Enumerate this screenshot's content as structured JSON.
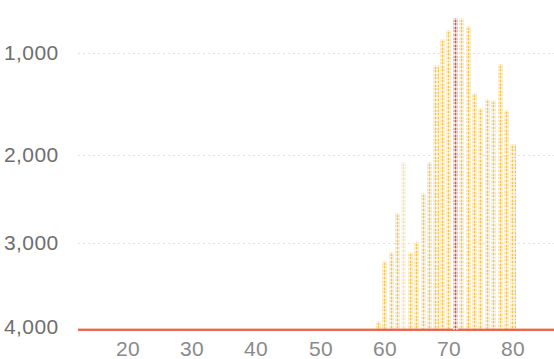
{
  "chart_data": {
    "type": "bar",
    "title": "",
    "subtitle": "",
    "xlabel": "",
    "ylabel": "",
    "orientation": "vertical",
    "y_axis_inverted": true,
    "grid": true,
    "legend": null,
    "xlim": [
      14,
      86
    ],
    "ylim": [
      4200,
      500
    ],
    "y_ticks": [
      1000,
      2000,
      3000,
      4000
    ],
    "y_tick_labels": [
      "1,000",
      "2,000",
      "3,000",
      "4,000"
    ],
    "x_ticks": [
      20,
      30,
      40,
      50,
      60,
      70,
      80
    ],
    "x_tick_labels": [
      "20",
      "30",
      "40",
      "50",
      "60",
      "70",
      "80"
    ],
    "baseline_value": 4000,
    "colors": {
      "bar": "#f2c04a",
      "bar_pale": "#f8dd9a",
      "highlight": "#d9452c",
      "baseline": "#e8553a",
      "gridline": "#d9dde3",
      "tick_label": "#7a7a7a"
    },
    "highlight_x": 71,
    "categories": [
      59,
      60,
      61,
      62,
      63,
      64,
      65,
      66,
      67,
      68,
      69,
      70,
      71,
      72,
      73,
      74,
      75,
      76,
      77,
      78,
      79,
      80
    ],
    "values": [
      3900,
      3250,
      3150,
      2730,
      2180,
      3150,
      3050,
      2520,
      2180,
      1130,
      850,
      750,
      620,
      620,
      710,
      1430,
      1600,
      1500,
      1510,
      1120,
      1620,
      1980
    ],
    "bar_shades": [
      "normal",
      "normal",
      "normal",
      "normal",
      "pale",
      "normal",
      "normal",
      "normal",
      "normal",
      "normal",
      "normal",
      "normal",
      "highlight",
      "normal",
      "normal",
      "normal",
      "normal",
      "normal",
      "normal",
      "normal",
      "normal",
      "normal"
    ]
  },
  "axes": {
    "y_labels": [
      "1,000",
      "2,000",
      "3,000",
      "4,000"
    ],
    "x_labels": [
      "20",
      "30",
      "40",
      "50",
      "60",
      "70",
      "80"
    ]
  }
}
